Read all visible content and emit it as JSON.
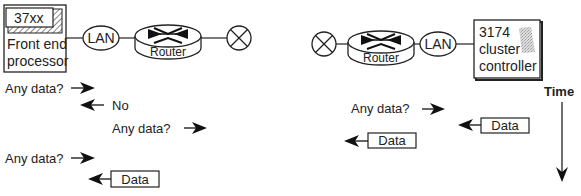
{
  "left_side": {
    "fep": {
      "model": "37xx",
      "label_line1": "Front end",
      "label_line2": "processor"
    },
    "lan_label": "LAN",
    "router_label": "Router"
  },
  "right_side": {
    "router_label": "Router",
    "lan_label": "LAN",
    "controller": {
      "line1": "3174",
      "line2": "cluster",
      "line3": "controller"
    }
  },
  "time_label": "Time",
  "messages": {
    "left": [
      {
        "text": "Any data?",
        "direction": "right"
      },
      {
        "text": "No",
        "direction": "left"
      },
      {
        "text": "Any data?",
        "direction": "right"
      },
      {
        "text": "Any data?",
        "direction": "right"
      },
      {
        "text": "Data",
        "direction": "left",
        "boxed": true
      }
    ],
    "right": [
      {
        "text": "Any data?",
        "direction": "right"
      },
      {
        "text": "Data",
        "direction": "left",
        "boxed": true
      },
      {
        "text": "Data",
        "direction": "left",
        "boxed": true
      }
    ]
  }
}
